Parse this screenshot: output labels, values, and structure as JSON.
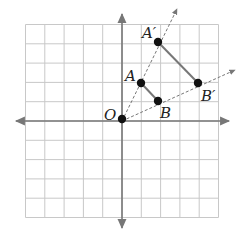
{
  "diagram": {
    "type": "coordinate-plane-dilation",
    "grid": {
      "xmin": -5,
      "xmax": 5,
      "ymin": -5,
      "ymax": 5,
      "step": 1
    },
    "colors": {
      "grid": "#c8c8c8",
      "axis": "#777777",
      "segment": "#777777",
      "ray": "#777777",
      "point": "#111111"
    },
    "points": [
      {
        "id": "O",
        "label": "O",
        "x": 0,
        "y": 0
      },
      {
        "id": "A",
        "label": "A",
        "x": 1,
        "y": 2
      },
      {
        "id": "B",
        "label": "B",
        "x": 2,
        "y": 1
      },
      {
        "id": "A_prime",
        "label": "A′",
        "x": 2,
        "y": 4
      },
      {
        "id": "B_prime",
        "label": "B′",
        "x": 4,
        "y": 2
      }
    ],
    "segments": [
      {
        "from": "A",
        "to": "B"
      },
      {
        "from": "A_prime",
        "to": "B_prime"
      }
    ],
    "rays": [
      {
        "from": "O",
        "through": "A_prime",
        "style": "dashed"
      },
      {
        "from": "O",
        "through": "B_prime",
        "style": "dashed"
      }
    ]
  }
}
